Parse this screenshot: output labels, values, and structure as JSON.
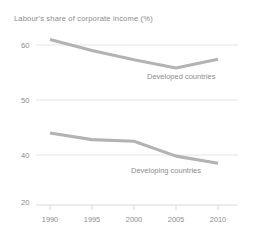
{
  "chart_data": {
    "type": "line",
    "title": "Labour's share of corporate income (%)",
    "xlabel": "",
    "ylabel": "",
    "x": [
      1990,
      1995,
      2000,
      2005,
      2010
    ],
    "xtick_labels": [
      "1990",
      "1995",
      "2000",
      "2005",
      "2010"
    ],
    "ytick_labels": [
      "60",
      "50",
      "40",
      "20"
    ],
    "ytick_values": [
      60,
      50,
      40,
      20
    ],
    "ylim": [
      20,
      62
    ],
    "xlim": [
      1990,
      2010
    ],
    "grid": true,
    "legend_position": "inline-annotation",
    "series": [
      {
        "name": "Developed countries",
        "values": [
          61.0,
          59.0,
          57.3,
          55.8,
          57.4
        ],
        "color": "#b3b3b3"
      },
      {
        "name": "Developing countries",
        "values": [
          44.0,
          42.8,
          42.5,
          39.8,
          38.5
        ],
        "color": "#b3b3b3"
      }
    ],
    "annotations": [
      {
        "text": "Developed countries",
        "series": "Developed countries"
      },
      {
        "text": "Developing countries",
        "series": "Developing countries"
      }
    ],
    "colors": {
      "background": "#ffffff",
      "line": "#b3b3b3",
      "grid": "#dedede",
      "text": "#8c8c8c"
    }
  }
}
